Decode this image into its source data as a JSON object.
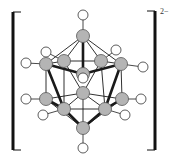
{
  "diagram": {
    "charge": "2−",
    "colors": {
      "boron_fill": "#b4b4b4",
      "hydrogen_fill": "#ffffff",
      "stroke": "#1a1a1a",
      "bracket": "#111111"
    },
    "brackets": {
      "left": {
        "x": 13,
        "top": 12,
        "bottom": 150,
        "serif": 21
      },
      "right": {
        "x": 155,
        "top": 11,
        "bottom": 150,
        "serif": 147
      }
    },
    "boron_atoms": [
      {
        "id": "B1",
        "x": 83,
        "y": 36
      },
      {
        "id": "B2",
        "x": 46,
        "y": 64
      },
      {
        "id": "B3",
        "x": 64,
        "y": 61
      },
      {
        "id": "B4",
        "x": 101,
        "y": 61
      },
      {
        "id": "B5",
        "x": 121,
        "y": 64
      },
      {
        "id": "B6",
        "x": 83,
        "y": 74
      },
      {
        "id": "B7",
        "x": 83,
        "y": 93
      },
      {
        "id": "B8",
        "x": 46,
        "y": 99
      },
      {
        "id": "B9",
        "x": 64,
        "y": 109
      },
      {
        "id": "B10",
        "x": 105,
        "y": 109
      },
      {
        "id": "B11",
        "x": 122,
        "y": 99
      },
      {
        "id": "B12",
        "x": 83,
        "y": 128
      }
    ],
    "hydrogen_atoms": [
      {
        "id": "H1",
        "x": 83,
        "y": 15,
        "bonded_to": "B1"
      },
      {
        "id": "H2",
        "x": 26,
        "y": 63,
        "bonded_to": "B2"
      },
      {
        "id": "H3",
        "x": 46,
        "y": 52,
        "bonded_to": "B3"
      },
      {
        "id": "H4",
        "x": 116,
        "y": 50,
        "bonded_to": "B4"
      },
      {
        "id": "H5",
        "x": 143,
        "y": 67,
        "bonded_to": "B5"
      },
      {
        "id": "H6",
        "x": 83,
        "y": 78,
        "bonded_to": "B6"
      },
      {
        "id": "H8",
        "x": 26,
        "y": 99,
        "bonded_to": "B8"
      },
      {
        "id": "H9",
        "x": 43,
        "y": 115,
        "bonded_to": "B9"
      },
      {
        "id": "H10",
        "x": 125,
        "y": 115,
        "bonded_to": "B10"
      },
      {
        "id": "H11",
        "x": 141,
        "y": 99,
        "bonded_to": "B11"
      },
      {
        "id": "H12",
        "x": 83,
        "y": 148,
        "bonded_to": "B12"
      }
    ],
    "bonds_thin": [
      [
        "B1",
        "B2"
      ],
      [
        "B1",
        "B3"
      ],
      [
        "B1",
        "B4"
      ],
      [
        "B1",
        "B5"
      ],
      [
        "B2",
        "B3"
      ],
      [
        "B3",
        "B4"
      ],
      [
        "B4",
        "B5"
      ],
      [
        "B2",
        "B8"
      ],
      [
        "B5",
        "B11"
      ],
      [
        "B3",
        "B7"
      ],
      [
        "B4",
        "B7"
      ],
      [
        "B3",
        "B9"
      ],
      [
        "B4",
        "B10"
      ],
      [
        "B8",
        "B7"
      ],
      [
        "B11",
        "B7"
      ],
      [
        "B7",
        "B12"
      ],
      [
        "B9",
        "B10"
      ],
      [
        "B8",
        "B12"
      ],
      [
        "B11",
        "B12"
      ],
      [
        "B9",
        "B7"
      ],
      [
        "B10",
        "B7"
      ]
    ],
    "bonds_thick": [
      [
        "B1",
        "B6"
      ],
      [
        "B2",
        "B6"
      ],
      [
        "B5",
        "B6"
      ],
      [
        "B2",
        "B9"
      ],
      [
        "B5",
        "B10"
      ],
      [
        "B8",
        "B9"
      ],
      [
        "B11",
        "B10"
      ],
      [
        "B9",
        "B12"
      ],
      [
        "B10",
        "B12"
      ]
    ]
  }
}
